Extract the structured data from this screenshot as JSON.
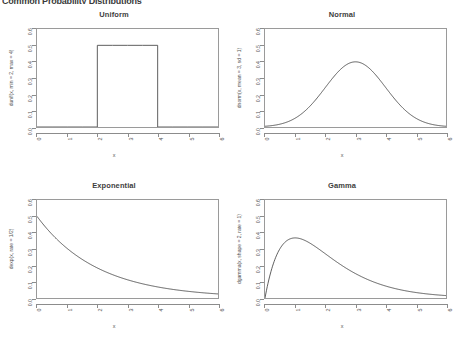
{
  "page": {
    "title": "Common Probability Distributions"
  },
  "axes": {
    "x_ticks": [
      "0",
      "1",
      "2",
      "3",
      "4",
      "5",
      "6"
    ],
    "x_values": [
      0,
      1,
      2,
      3,
      4,
      5,
      6
    ],
    "y_ticks": [
      "0.0",
      "0.1",
      "0.2",
      "0.3",
      "0.4",
      "0.5",
      "0.6"
    ],
    "y_values": [
      0.0,
      0.1,
      0.2,
      0.3,
      0.4,
      0.5,
      0.6
    ],
    "xlabel": "x",
    "xlim": [
      0,
      6
    ],
    "ylim": [
      0,
      0.6
    ]
  },
  "chart_data": [
    {
      "type": "line",
      "panel": "top-left",
      "title": "Uniform",
      "xlabel": "x",
      "ylabel": "dunif(x, min = 2, max = 4)",
      "xlim": [
        0,
        6
      ],
      "ylim": [
        0,
        0.6
      ],
      "grid": false,
      "legend": "none",
      "line_color": "#4d4d4d",
      "distribution": "uniform",
      "parameters": {
        "min": 2,
        "max": 4
      },
      "x": [
        0,
        0.5,
        1,
        1.5,
        2,
        2,
        2.5,
        3,
        3.5,
        4,
        4,
        4.5,
        5,
        5.5,
        6
      ],
      "values": [
        0,
        0,
        0,
        0,
        0,
        0.5,
        0.5,
        0.5,
        0.5,
        0.5,
        0,
        0,
        0,
        0,
        0
      ]
    },
    {
      "type": "line",
      "panel": "top-right",
      "title": "Normal",
      "xlabel": "x",
      "ylabel": "dnorm(x, mean = 3, sd = 1)",
      "xlim": [
        0,
        6
      ],
      "ylim": [
        0,
        0.6
      ],
      "grid": false,
      "legend": "none",
      "line_color": "#4d4d4d",
      "distribution": "normal",
      "parameters": {
        "mean": 3,
        "sd": 1
      },
      "x": [
        0,
        0.5,
        1,
        1.5,
        2,
        2.5,
        3,
        3.5,
        4,
        4.5,
        5,
        5.5,
        6
      ],
      "values": [
        0.004,
        0.018,
        0.054,
        0.13,
        0.242,
        0.352,
        0.399,
        0.352,
        0.242,
        0.13,
        0.054,
        0.018,
        0.004
      ]
    },
    {
      "type": "line",
      "panel": "bottom-left",
      "title": "Exponential",
      "xlabel": "x",
      "ylabel": "dexp(x, rate = 1/2)",
      "xlim": [
        0,
        6
      ],
      "ylim": [
        0,
        0.6
      ],
      "grid": false,
      "legend": "none",
      "line_color": "#4d4d4d",
      "distribution": "exponential",
      "parameters": {
        "rate": 0.5
      },
      "x": [
        0,
        0.5,
        1,
        1.5,
        2,
        2.5,
        3,
        3.5,
        4,
        4.5,
        5,
        5.5,
        6
      ],
      "values": [
        0.5,
        0.389,
        0.303,
        0.236,
        0.184,
        0.143,
        0.112,
        0.087,
        0.068,
        0.053,
        0.041,
        0.032,
        0.025
      ]
    },
    {
      "type": "line",
      "panel": "bottom-right",
      "title": "Gamma",
      "xlabel": "x",
      "ylabel": "dgamma(x, shape = 2, rate = 1)",
      "xlim": [
        0,
        6
      ],
      "ylim": [
        0,
        0.6
      ],
      "grid": false,
      "legend": "none",
      "line_color": "#4d4d4d",
      "distribution": "gamma",
      "parameters": {
        "shape": 2,
        "rate": 1
      },
      "x": [
        0,
        0.25,
        0.5,
        0.75,
        1,
        1.5,
        2,
        2.5,
        3,
        3.5,
        4,
        4.5,
        5,
        5.5,
        6
      ],
      "values": [
        0,
        0.195,
        0.303,
        0.354,
        0.368,
        0.335,
        0.271,
        0.205,
        0.149,
        0.106,
        0.073,
        0.05,
        0.034,
        0.022,
        0.015
      ]
    }
  ]
}
